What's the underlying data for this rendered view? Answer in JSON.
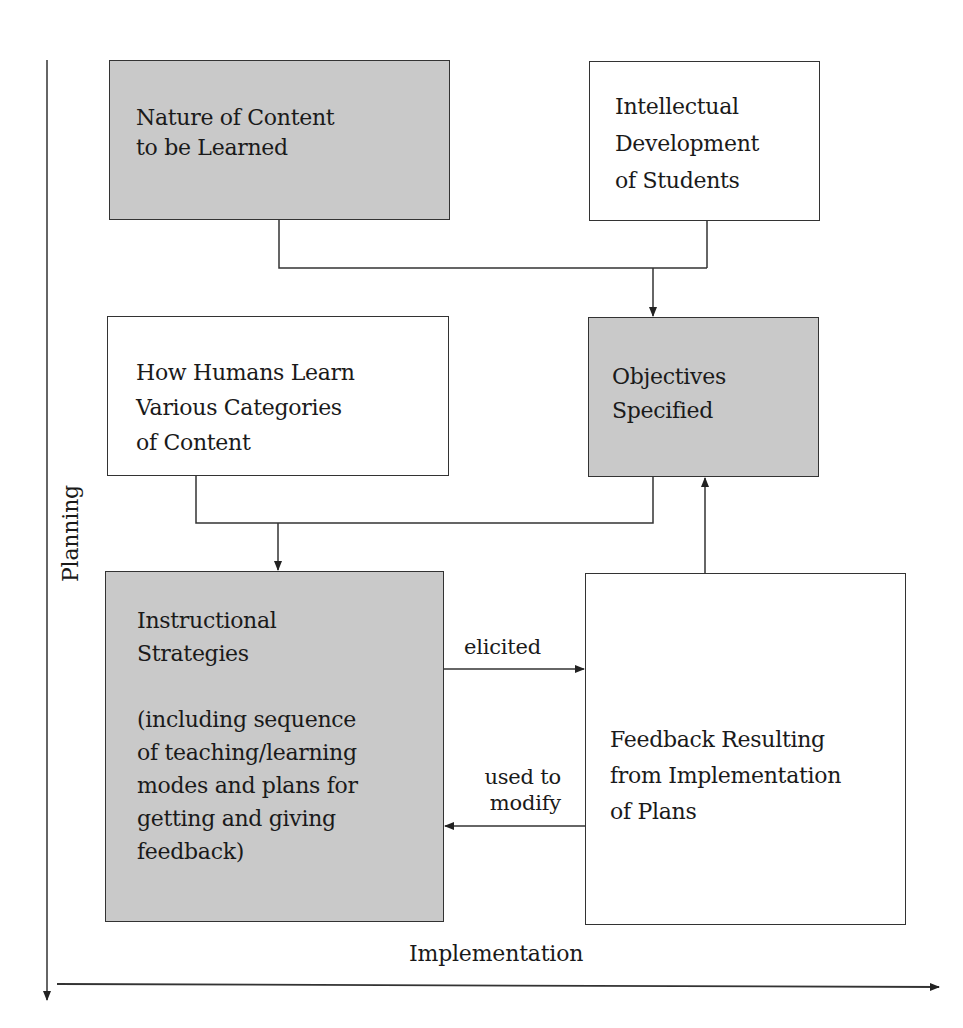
{
  "diagram": {
    "boxes": {
      "nature_of_content": {
        "text": "Nature of Content\nto be Learned",
        "fill": "#c9c9c9"
      },
      "intellectual_development": {
        "text": "Intellectual\nDevelopment\nof Students",
        "fill": "#ffffff"
      },
      "how_humans_learn": {
        "text": "How Humans Learn\nVarious Categories\nof Content",
        "fill": "#ffffff"
      },
      "objectives_specified": {
        "text": "Objectives\nSpecified",
        "fill": "#c9c9c9"
      },
      "instructional_strategies": {
        "text": "Instructional\nStrategies\n\n(including sequence\nof teaching/learning\nmodes and plans for\ngetting and giving\nfeedback)",
        "fill": "#c9c9c9"
      },
      "feedback_resulting": {
        "text": "Feedback Resulting\nfrom Implementation\nof Plans",
        "fill": "#ffffff"
      }
    },
    "edge_labels": {
      "elicited": "elicited",
      "used_to_modify": "used to\nmodify"
    },
    "axes": {
      "vertical": "Planning",
      "horizontal": "Implementation"
    },
    "connections": [
      {
        "from": "nature_of_content",
        "to": "objectives_specified"
      },
      {
        "from": "intellectual_development",
        "to": "objectives_specified"
      },
      {
        "from": "how_humans_learn",
        "to": "instructional_strategies"
      },
      {
        "from": "objectives_specified",
        "to": "instructional_strategies"
      },
      {
        "from": "instructional_strategies",
        "to": "feedback_resulting",
        "label": "elicited"
      },
      {
        "from": "feedback_resulting",
        "to": "instructional_strategies",
        "label": "used to modify"
      },
      {
        "from": "feedback_resulting",
        "to": "objectives_specified"
      }
    ]
  }
}
